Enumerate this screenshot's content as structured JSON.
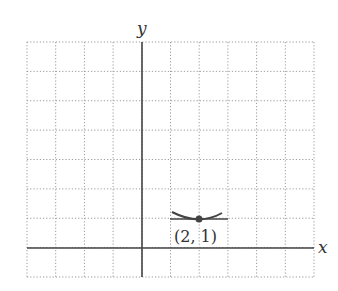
{
  "chart_data": {
    "type": "line",
    "title": "",
    "xlabel": "x",
    "ylabel": "y",
    "xlim": [
      -4,
      6
    ],
    "ylim": [
      -1,
      7
    ],
    "grid": true,
    "grid_style": "dotted",
    "series": [
      {
        "name": "curve",
        "description": "curve with local minimum at (2,1)",
        "x": [
          1.05,
          1.5,
          2,
          2.5,
          2.8
        ],
        "y": [
          1.25,
          1.08,
          1.0,
          1.08,
          1.2
        ]
      },
      {
        "name": "tangent line",
        "description": "horizontal tangent line at (2,1)",
        "x": [
          1,
          3
        ],
        "y": [
          1,
          1
        ]
      }
    ],
    "points": [
      {
        "x": 2,
        "y": 1,
        "label": "(2, 1)"
      }
    ],
    "annotations": [
      "(2, 1)"
    ]
  },
  "labels": {
    "x_axis": "x",
    "y_axis": "y",
    "point": "(2, 1)"
  },
  "colors": {
    "axis": "#444444",
    "grid": "#9a9a9a",
    "curve": "#444444"
  }
}
